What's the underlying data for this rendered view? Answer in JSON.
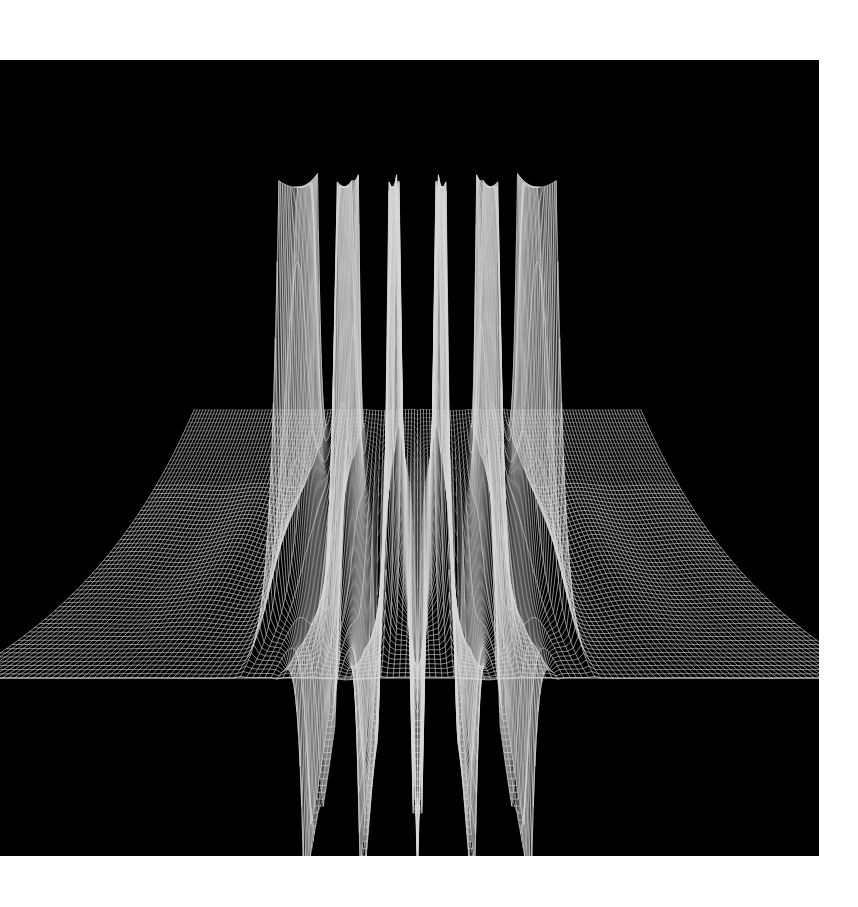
{
  "figure": {
    "title": "",
    "background_color": "#ffffff",
    "panel_color": "#000000",
    "mesh_color": "#d8d8d8",
    "panel": {
      "left": 0,
      "top": 60,
      "width": 819,
      "height": 796
    }
  },
  "chart_data": {
    "type": "line",
    "render_style": "3d-wireframe-surface-mesh",
    "title": "",
    "subtitle": "",
    "xlabel": "",
    "ylabel": "",
    "zlabel": "",
    "grid": false,
    "legend": null,
    "axis_visible": false,
    "tick_labels": [],
    "surface": {
      "function_family": "reciprocal-pole / tangent-like periodic singularity",
      "x_range": [
        -6.5,
        6.5
      ],
      "y_range": [
        -3.2,
        3.2
      ],
      "z_range": [
        -1.0,
        1.0
      ],
      "z_clip": [
        -0.62,
        1.0
      ],
      "grid_nu": 150,
      "grid_nv": 64,
      "pole_axis": "x",
      "pole_spacing": 1.0
    },
    "projection": {
      "type": "perspective",
      "azimuth_deg": 0,
      "elevation_deg": 14,
      "distance": 7.2,
      "vertical_exaggeration": 1.0,
      "horizon_y_px": 678
    },
    "positive_spikes": {
      "count": 6,
      "tip_x_px": [
        273,
        325,
        375,
        425,
        478,
        532
      ],
      "tip_y_px": [
        137,
        142,
        140,
        144,
        141,
        145
      ],
      "x_values": [
        -2.5,
        -1.5,
        -0.5,
        0.5,
        1.5,
        2.5
      ],
      "peak_z": 1.0
    },
    "negative_spikes": {
      "count": 5,
      "tip_x_px": [
        300,
        352,
        403,
        453,
        505
      ],
      "tip_y_px": [
        782,
        784,
        782,
        784,
        783
      ],
      "x_values": [
        -2.0,
        -1.0,
        0.0,
        1.0,
        2.0
      ],
      "trough_z": -0.62
    },
    "base_plane": {
      "front_edge_y_px": 678,
      "left_corner_px": [
        0,
        663
      ],
      "right_corner_px": [
        818,
        678
      ],
      "visible": true
    },
    "series": [
      {
        "name": "mesh-u-lines",
        "orientation": "along-x",
        "count": 64
      },
      {
        "name": "mesh-v-lines",
        "orientation": "along-y",
        "count": 150
      }
    ]
  }
}
